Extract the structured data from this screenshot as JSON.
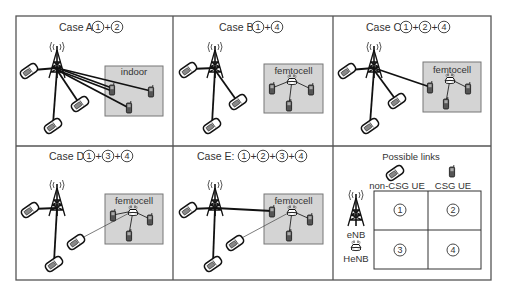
{
  "figure": {
    "panels": [
      {
        "id": "A",
        "title": "Case A:",
        "links": [
          "1",
          "2"
        ],
        "room_label": "indoor"
      },
      {
        "id": "B",
        "title": "Case B:",
        "links": [
          "1",
          "4"
        ],
        "room_label": "femtocell"
      },
      {
        "id": "C",
        "title": "Case C:",
        "links": [
          "1",
          "2",
          "4"
        ],
        "room_label": "femtocell"
      },
      {
        "id": "D",
        "title": "Case D:",
        "links": [
          "1",
          "3",
          "4"
        ],
        "room_label": "femtocell"
      },
      {
        "id": "E",
        "title": "Case E:",
        "links": [
          "1",
          "2",
          "3",
          "4"
        ],
        "room_label": "femtocell"
      }
    ],
    "plus": "+",
    "legend": {
      "title": "Possible links",
      "col_headers": [
        "non-CSG UE",
        "CSG UE"
      ],
      "row_headers": [
        "eNB",
        "HeNB"
      ],
      "cells": [
        [
          "1",
          "2"
        ],
        [
          "3",
          "4"
        ]
      ]
    },
    "icons": {
      "macro_bs": "cell-tower-icon",
      "femto_bs": "henb-router-icon",
      "non_csg_ue": "flip-phone-icon",
      "csg_ue": "candybar-phone-icon"
    },
    "colors": {
      "frame": "#555555",
      "room_fill": "#d4d4d4",
      "link": "#111111"
    }
  }
}
